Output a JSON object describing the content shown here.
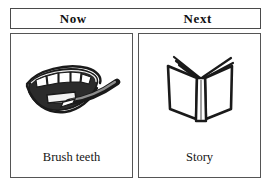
{
  "board": {
    "type": "now-next-visual-schedule-board",
    "header": {
      "columns": [
        {
          "label": "Now"
        },
        {
          "label": "Next"
        }
      ]
    },
    "cards": [
      {
        "column": "Now",
        "caption": "Brush teeth",
        "icon": "mouth-with-teeth-and-toothbrush-icon"
      },
      {
        "column": "Next",
        "caption": "Story",
        "icon": "open-book-icon"
      }
    ]
  },
  "colors": {
    "background": "#ffffff",
    "border": "#4a4a4a",
    "ink": "#1a1a1a",
    "fill_dark": "#2b2b2b"
  }
}
